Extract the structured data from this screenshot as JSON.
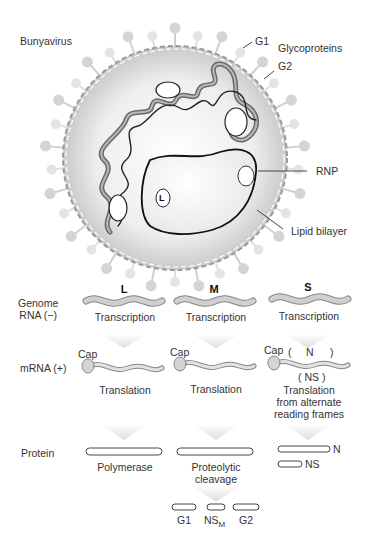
{
  "virus": {
    "title": "Bunyavirus",
    "labels": {
      "g1": "G1",
      "g2": "G2",
      "glycoproteins": "Glycoproteins",
      "rnp": "RNP",
      "lipid_bilayer": "Lipid bilayer",
      "polymerase_marker": "L"
    }
  },
  "rows": {
    "genome": "Genome\nRNA (−)",
    "mrna": "mRNA (+)",
    "protein": "Protein"
  },
  "segments": [
    {
      "name": "L",
      "step1": "Transcription",
      "cap": "Cap",
      "step2": "Translation",
      "proteins": [
        "Polymerase"
      ]
    },
    {
      "name": "M",
      "step1": "Transcription",
      "cap": "Cap",
      "step2": "Translation",
      "protein_step": "Proteolytic\ncleavage",
      "products": [
        "G1",
        "NS",
        "G2"
      ],
      "products_subscript": "M"
    },
    {
      "name": "S",
      "step1": "Transcription",
      "cap": "Cap",
      "frame_top": "(        N        )",
      "frame_top_n": "N",
      "frame_bottom": "( NS )",
      "step2": "Translation\nfrom alternate\nreading frames",
      "proteins": [
        "N",
        "NS"
      ]
    }
  ],
  "colors": {
    "envelope_fill": "#d9d9d9",
    "spike": "#cfcfcf",
    "rna_fill": "#c8c8c8",
    "rna_stroke": "#888888",
    "arrow": "#e8e8e8"
  }
}
